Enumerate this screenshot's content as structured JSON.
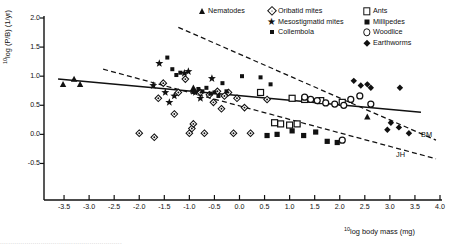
{
  "chart_data": {
    "type": "scatter",
    "title": "",
    "xlabel": "10log body mass (mg)",
    "ylabel": "10log (P/B) (1/yr)",
    "xlim": [
      -3.9,
      4.0
    ],
    "ylim": [
      -0.75,
      2.0
    ],
    "xticks": [
      -3.5,
      -3.0,
      -2.5,
      -2.0,
      -1.5,
      -1.0,
      -0.5,
      0.0,
      0.5,
      1.0,
      1.5,
      2.0,
      2.5,
      3.0,
      3.5,
      4.0
    ],
    "xticklabels": [
      "-3.5",
      "-3.0",
      "-2.5",
      "-2.0",
      "-1.5",
      "-1.0",
      "-0.5",
      "0.0",
      "0.5",
      "1.0",
      "1.5",
      "2.0",
      "2.5",
      "3.0",
      "3.5",
      "4.0"
    ],
    "yticks": [
      2.0,
      1.5,
      1.0,
      0.5,
      0.0,
      -0.5
    ],
    "yticklabels": [
      "2.0",
      "1.5",
      "1.0",
      "0.5",
      "0.0",
      "-0.5"
    ],
    "grid": false,
    "legend_position": "top-right",
    "series": [
      {
        "name": "Nematodes",
        "marker": "triangle-filled",
        "points": [
          [
            -3.52,
            0.86
          ],
          [
            -3.3,
            0.95
          ],
          [
            -3.18,
            0.86
          ],
          [
            -0.92,
            0.8
          ],
          [
            2.55,
            0.3
          ]
        ]
      },
      {
        "name": "Oribatid mites",
        "marker": "diamond-open-dot",
        "points": [
          [
            -1.62,
            0.62
          ],
          [
            -1.52,
            0.88
          ],
          [
            -1.3,
            0.35
          ],
          [
            -1.22,
            0.72
          ],
          [
            -1.08,
            0.95
          ],
          [
            -1.0,
            0.02
          ],
          [
            -0.95,
            0.1
          ],
          [
            -0.92,
            0.18
          ],
          [
            -0.78,
            0.72
          ],
          [
            -0.7,
            0.02
          ],
          [
            -0.6,
            0.68
          ],
          [
            -0.52,
            0.55
          ],
          [
            -0.44,
            0.74
          ],
          [
            -0.36,
            0.44
          ],
          [
            -0.3,
            0.66
          ],
          [
            -0.22,
            0.72
          ],
          [
            -0.12,
            0.02
          ],
          [
            -0.05,
            0.62
          ],
          [
            0.1,
            0.46
          ],
          [
            0.22,
            0.02
          ],
          [
            -2.0,
            0.02
          ],
          [
            -1.7,
            -0.05
          ],
          [
            0.55,
            0.6
          ]
        ]
      },
      {
        "name": "Mesostigmatid mites",
        "marker": "star-filled",
        "points": [
          [
            -1.72,
            0.84
          ],
          [
            -1.6,
            1.22
          ],
          [
            -1.48,
            0.72
          ],
          [
            -1.4,
            0.55
          ],
          [
            -1.1,
            1.05
          ],
          [
            -1.02,
            1.08
          ],
          [
            -0.88,
            0.72
          ],
          [
            -0.78,
            0.62
          ],
          [
            -0.55,
            0.96
          ],
          [
            -0.92,
            0.74
          ],
          [
            -1.3,
            0.66
          ]
        ]
      },
      {
        "name": "Collembola",
        "marker": "square-filled-small",
        "points": [
          [
            -1.44,
            1.32
          ],
          [
            -1.34,
            1.12
          ],
          [
            -1.26,
            1.02
          ],
          [
            -1.18,
            1.06
          ],
          [
            -0.82,
            0.78
          ],
          [
            -0.74,
            0.74
          ],
          [
            -0.66,
            0.8
          ],
          [
            -0.58,
            0.7
          ],
          [
            -0.5,
            0.72
          ],
          [
            -0.42,
            0.66
          ],
          [
            -0.34,
            0.88
          ],
          [
            -0.26,
            0.74
          ],
          [
            0.05,
            1.0
          ],
          [
            0.42,
            0.98
          ],
          [
            0.62,
            0.86
          ]
        ]
      },
      {
        "name": "Ants",
        "marker": "square-open",
        "points": [
          [
            0.42,
            0.72
          ],
          [
            1.05,
            0.62
          ],
          [
            1.3,
            0.6
          ],
          [
            0.82,
            0.18
          ],
          [
            1.0,
            0.16
          ],
          [
            1.15,
            0.18
          ],
          [
            0.7,
            0.2
          ],
          [
            1.62,
            0.58
          ],
          [
            2.05,
            0.55
          ]
        ]
      },
      {
        "name": "Millipedes",
        "marker": "square-filled",
        "points": [
          [
            0.55,
            -0.02
          ],
          [
            0.75,
            0.0
          ],
          [
            1.05,
            0.06
          ],
          [
            1.28,
            -0.02
          ],
          [
            1.52,
            0.04
          ],
          [
            1.75,
            -0.12
          ],
          [
            1.95,
            -0.14
          ]
        ]
      },
      {
        "name": "Woodlice",
        "marker": "circle-open",
        "points": [
          [
            1.3,
            0.64
          ],
          [
            1.55,
            0.58
          ],
          [
            1.72,
            0.54
          ],
          [
            1.9,
            0.52
          ],
          [
            2.08,
            0.5
          ],
          [
            2.22,
            0.6
          ],
          [
            2.4,
            0.66
          ],
          [
            2.62,
            0.52
          ],
          [
            2.05,
            -0.1
          ],
          [
            1.42,
            0.6
          ]
        ]
      },
      {
        "name": "Earthworms",
        "marker": "diamond-filled",
        "points": [
          [
            2.28,
            0.92
          ],
          [
            2.42,
            0.84
          ],
          [
            2.55,
            0.86
          ],
          [
            2.62,
            0.8
          ],
          [
            3.2,
            0.8
          ],
          [
            3.02,
            0.2
          ],
          [
            3.18,
            0.12
          ],
          [
            3.38,
            0.02
          ],
          [
            2.95,
            0.08
          ]
        ]
      }
    ],
    "trendlines": [
      {
        "name": "overall",
        "style": "solid",
        "label": "",
        "x0": -3.62,
        "y0": 0.95,
        "x1": 3.62,
        "y1": 0.38
      },
      {
        "name": "BM",
        "style": "dashed",
        "label": "BM",
        "x0": -1.22,
        "y0": 1.84,
        "x1": 3.92,
        "y1": -0.1
      },
      {
        "name": "JH",
        "style": "dashed",
        "label": "JH",
        "x0": -2.72,
        "y0": 1.12,
        "x1": 3.92,
        "y1": -0.42
      }
    ],
    "annotations": [
      {
        "text": "BM",
        "x": 3.62,
        "y": -0.02
      },
      {
        "text": "JH",
        "x": 3.12,
        "y": -0.38
      }
    ]
  },
  "axes": {
    "y_label_prefix": "10",
    "y_label_main": "log (P/B) (1/yr)",
    "x_label_prefix": "10",
    "x_label_main": "log body mass (mg)"
  },
  "legend": {
    "columns": [
      {
        "items": [
          {
            "label": "Nematodes",
            "marker": "triangle-filled-icon"
          }
        ]
      },
      {
        "items": [
          {
            "label": "Oribatid mites",
            "marker": "diamond-open-dot-icon"
          },
          {
            "label": "Mesostigmatid mites",
            "marker": "star-filled-icon"
          },
          {
            "label": "Collembola",
            "marker": "square-filled-small-icon"
          }
        ]
      },
      {
        "items": [
          {
            "label": "Ants",
            "marker": "square-open-icon"
          },
          {
            "label": "Millipedes",
            "marker": "square-filled-icon"
          },
          {
            "label": "Woodlice",
            "marker": "circle-open-icon"
          },
          {
            "label": "Earthworms",
            "marker": "diamond-filled-icon"
          }
        ]
      }
    ]
  },
  "caption": {
    "text": "............................................................"
  },
  "colors": {
    "ink": "#111111",
    "background": "#ffffff"
  }
}
